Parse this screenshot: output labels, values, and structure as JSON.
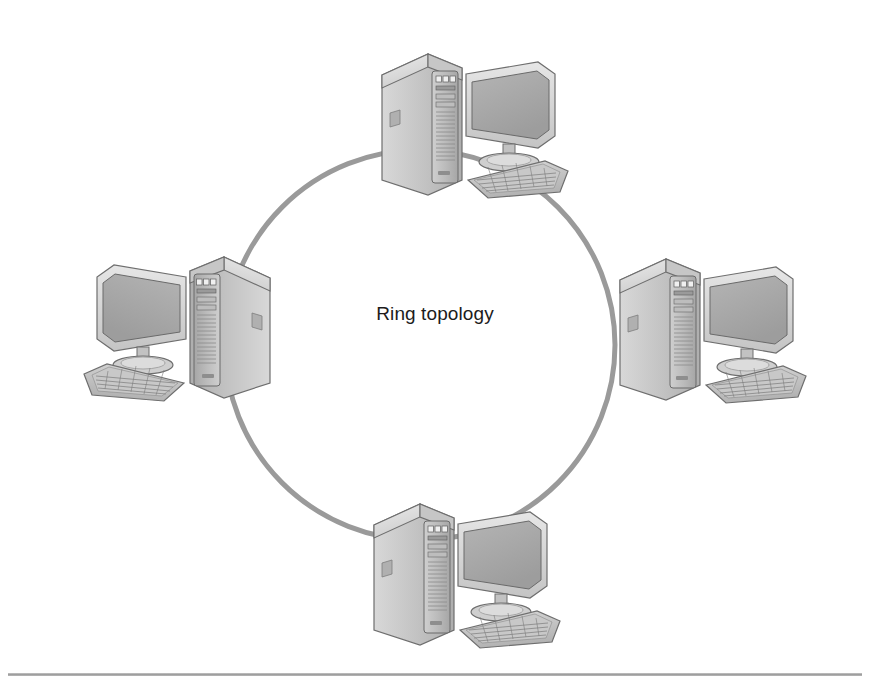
{
  "figure": {
    "title": "Ring topology",
    "label_text": "Ring topology",
    "background_color": "#ffffff",
    "ring_color": "#9a9a9a",
    "ring_width_px": 5,
    "text_color": "#1c1c1c",
    "rule_color": "#a0a0a0"
  },
  "diagram_data": {
    "type": "network-topology",
    "topology": "ring",
    "node_count": 4,
    "label": "Ring topology",
    "ring": {
      "center_x": 420,
      "center_y": 345,
      "radius": 195,
      "stroke": "#9a9a9a",
      "stroke_width": 5,
      "fill": "none"
    },
    "nodes": [
      {
        "id": "node-top",
        "name": "computer-top",
        "position": "top",
        "x": 370,
        "y": 40,
        "mirrored": false,
        "parts": [
          "tower",
          "monitor",
          "keyboard"
        ]
      },
      {
        "id": "node-left",
        "name": "computer-left",
        "position": "left",
        "x": 82,
        "y": 243,
        "mirrored": true,
        "parts": [
          "tower",
          "monitor",
          "keyboard"
        ]
      },
      {
        "id": "node-right",
        "name": "computer-right",
        "position": "right",
        "x": 608,
        "y": 245,
        "mirrored": false,
        "parts": [
          "tower",
          "monitor",
          "keyboard"
        ]
      },
      {
        "id": "node-bottom",
        "name": "computer-bottom",
        "position": "bottom",
        "x": 362,
        "y": 490,
        "mirrored": false,
        "parts": [
          "tower",
          "monitor",
          "keyboard"
        ]
      }
    ],
    "links": [
      {
        "from": "node-top",
        "to": "node-right",
        "style": "arc"
      },
      {
        "from": "node-right",
        "to": "node-bottom",
        "style": "arc"
      },
      {
        "from": "node-bottom",
        "to": "node-left",
        "style": "arc"
      },
      {
        "from": "node-left",
        "to": "node-top",
        "style": "arc"
      }
    ]
  },
  "footer": {
    "rule_visible": true
  }
}
